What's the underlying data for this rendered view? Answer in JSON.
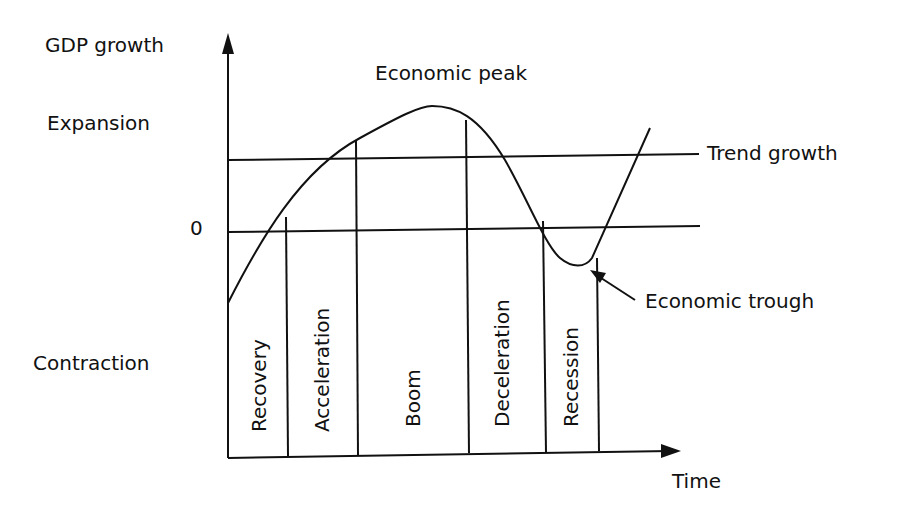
{
  "diagram": {
    "y_axis_label": "GDP growth",
    "x_axis_label": "Time",
    "zero_label": "0",
    "region_labels": {
      "expansion": "Expansion",
      "contraction": "Contraction"
    },
    "reference_lines": {
      "trend": "Trend growth"
    },
    "annotations": {
      "peak": "Economic peak",
      "trough": "Economic trough"
    },
    "phases": [
      {
        "label": "Recovery"
      },
      {
        "label": "Acceleration"
      },
      {
        "label": "Boom"
      },
      {
        "label": "Deceleration"
      },
      {
        "label": "Recession"
      }
    ],
    "colors": {
      "ink": "#111111",
      "background": "#ffffff"
    }
  }
}
